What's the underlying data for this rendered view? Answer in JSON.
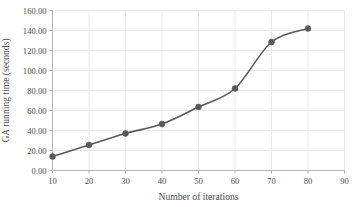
{
  "chart_data": {
    "type": "line",
    "title": "",
    "subtitle": "",
    "xlabel": "Number of iterations",
    "ylabel": "GA running time (seconds)",
    "x": [
      10,
      20,
      30,
      40,
      50,
      60,
      70,
      80
    ],
    "values": [
      14.0,
      25.5,
      37.0,
      46.5,
      63.5,
      82.0,
      128.5,
      142.0
    ],
    "series": [
      {
        "name": "GA running time",
        "values": [
          14.0,
          25.5,
          37.0,
          46.5,
          63.5,
          82.0,
          128.5,
          142.0
        ]
      }
    ],
    "xlim": [
      10,
      90
    ],
    "ylim": [
      0,
      160
    ],
    "xticks": [
      10,
      20,
      30,
      40,
      50,
      60,
      70,
      80,
      90
    ],
    "yticks": [
      0,
      20,
      40,
      60,
      80,
      100,
      120,
      140,
      160
    ],
    "xtick_labels": [
      "10",
      "20",
      "30",
      "40",
      "50",
      "60",
      "70",
      "80",
      "90"
    ],
    "ytick_labels": [
      "0.00",
      "20.00",
      "40.00",
      "60.00",
      "80.00",
      "100.00",
      "120.00",
      "140.00",
      "160.00"
    ],
    "grid": "horizontal-and-vertical",
    "legend": "none",
    "marker": "circle",
    "smoothed": true,
    "line_color": "#595959",
    "marker_color": "#595959",
    "grid_color": "#e8e8ea",
    "axis_color": "#b3b3b3",
    "tick_label_color": "#4a4a4a",
    "background": "#ffffff"
  }
}
